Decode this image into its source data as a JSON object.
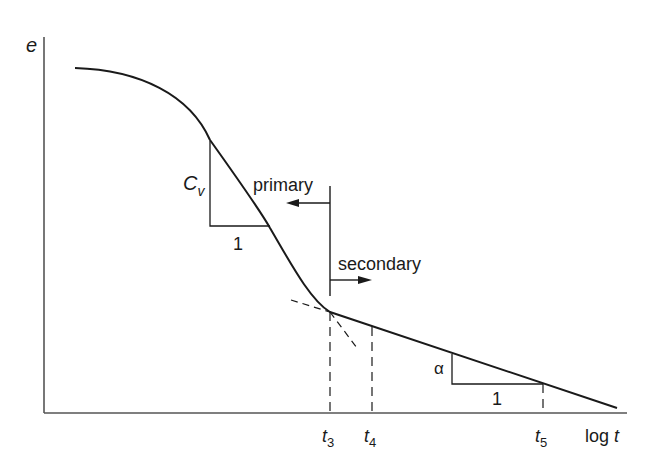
{
  "figure": {
    "title": "",
    "y_axis_label": "e",
    "x_axis_label": "log t",
    "x_axis_label_parts": {
      "prefix": "log ",
      "var": "t"
    },
    "regions": {
      "primary": "primary",
      "secondary": "secondary"
    },
    "slope_primary": {
      "rise_label": "C",
      "rise_sub": "v",
      "run_label": "1"
    },
    "slope_secondary": {
      "rise_label": "α",
      "run_label": "1"
    },
    "ticks": [
      {
        "var": "t",
        "sub": "3"
      },
      {
        "var": "t",
        "sub": "4"
      },
      {
        "var": "t",
        "sub": "5"
      }
    ],
    "colors": {
      "line": "#1a1a1a",
      "axis": "#555555",
      "background": "#ffffff"
    }
  }
}
